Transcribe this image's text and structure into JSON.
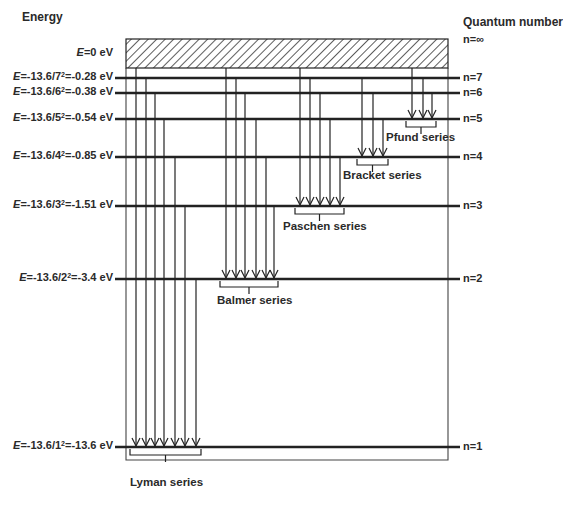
{
  "axis_titles": {
    "left": "Energy",
    "right": "Quantum number"
  },
  "continuum": {
    "energy_label_prefix": "E",
    "energy_label_rest": "=0 eV",
    "quantum_label": "n=∞",
    "box": {
      "x1": 126,
      "x2": 448,
      "y1": 39,
      "y2": 68
    },
    "fill": "hatched"
  },
  "frame": {
    "x1": 126,
    "x2": 448,
    "y_bottom": 460
  },
  "level_line": {
    "x1": 115,
    "x2": 460,
    "color": "#222222"
  },
  "levels": [
    {
      "n": 7,
      "y": 78,
      "label_prefix": "E",
      "label_mid": "=-13.6/7",
      "label_sup": "2",
      "label_end": "=-0.28 eV",
      "quantum_label": "n=7"
    },
    {
      "n": 6,
      "y": 93,
      "label_prefix": "E",
      "label_mid": "=-13.6/6",
      "label_sup": "2",
      "label_end": "=-0.38 eV",
      "quantum_label": "n=6"
    },
    {
      "n": 5,
      "y": 119,
      "label_prefix": "E",
      "label_mid": "=-13.6/5",
      "label_sup": "2",
      "label_end": "=-0.54 eV",
      "quantum_label": "n=5"
    },
    {
      "n": 4,
      "y": 157,
      "label_prefix": "E",
      "label_mid": "=-13.6/4",
      "label_sup": "2",
      "label_end": "=-0.85 eV",
      "quantum_label": "n=4"
    },
    {
      "n": 3,
      "y": 206,
      "label_prefix": "E",
      "label_mid": "=-13.6/3",
      "label_sup": "2",
      "label_end": "=-1.51 eV",
      "quantum_label": "n=3"
    },
    {
      "n": 2,
      "y": 279,
      "label_prefix": "E",
      "label_mid": "=-13.6/2",
      "label_sup": "2",
      "label_end": "=-3.4 eV",
      "quantum_label": "n=2"
    },
    {
      "n": 1,
      "y": 447,
      "label_prefix": "E",
      "label_mid": "=-13.6/1",
      "label_sup": "2",
      "label_end": "=-13.6 eV",
      "quantum_label": "n=1"
    }
  ],
  "series": [
    {
      "name": "Lyman series",
      "to_n": 1,
      "transitions": [
        {
          "x": 136,
          "from": "inf"
        },
        {
          "x": 146,
          "from": 7
        },
        {
          "x": 155,
          "from": 6
        },
        {
          "x": 164,
          "from": 5
        },
        {
          "x": 175,
          "from": 4
        },
        {
          "x": 185,
          "from": 3
        },
        {
          "x": 196,
          "from": 2
        }
      ],
      "brace": {
        "x1": 130,
        "x2": 201
      },
      "label_pos": {
        "x": 130,
        "y": 482
      }
    },
    {
      "name": "Balmer series",
      "to_n": 2,
      "transitions": [
        {
          "x": 226,
          "from": "inf"
        },
        {
          "x": 236,
          "from": 7
        },
        {
          "x": 245,
          "from": 6
        },
        {
          "x": 256,
          "from": 5
        },
        {
          "x": 266,
          "from": 4
        },
        {
          "x": 274,
          "from": 3
        }
      ],
      "brace": {
        "x1": 220,
        "x2": 278
      },
      "label_pos": {
        "x": 217,
        "y": 300
      }
    },
    {
      "name": "Paschen series",
      "to_n": 3,
      "transitions": [
        {
          "x": 300,
          "from": "inf"
        },
        {
          "x": 310,
          "from": 7
        },
        {
          "x": 320,
          "from": 6
        },
        {
          "x": 330,
          "from": 5
        },
        {
          "x": 340,
          "from": 4
        }
      ],
      "brace": {
        "x1": 295,
        "x2": 344
      },
      "label_pos": {
        "x": 283,
        "y": 226
      }
    },
    {
      "name": "Bracket series",
      "to_n": 4,
      "transitions": [
        {
          "x": 362,
          "from": 7
        },
        {
          "x": 373,
          "from": 6
        },
        {
          "x": 383,
          "from": 5
        }
      ],
      "brace": {
        "x1": 357,
        "x2": 388
      },
      "label_pos": {
        "x": 343,
        "y": 175
      }
    },
    {
      "name": "Pfund series",
      "to_n": 5,
      "transitions": [
        {
          "x": 412,
          "from": "inf"
        },
        {
          "x": 423,
          "from": 7
        },
        {
          "x": 432,
          "from": 6
        }
      ],
      "brace": {
        "x1": 406,
        "x2": 436
      },
      "label_pos": {
        "x": 386,
        "y": 137
      }
    }
  ]
}
